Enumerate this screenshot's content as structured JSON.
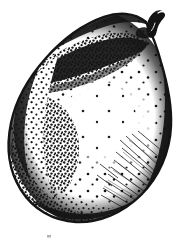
{
  "artwork": {
    "title": "Pear",
    "subject": "pear-fruit",
    "medium": "pen-and-ink stipple and hatch engraving",
    "style": "monochrome line art",
    "orientation": "upright, stem at upper right",
    "canvas": {
      "width": 184,
      "height": 243
    },
    "colors": {
      "background": "#ffffff",
      "ink": "#141414",
      "ink_mid": "#3a3a3a",
      "ink_light": "#777777"
    },
    "parts": [
      {
        "id": "stem",
        "label": "Stem",
        "note": "short dark curved stalk at top right, tilted right"
      },
      {
        "id": "body",
        "label": "Body",
        "note": "rounded pear silhouette, narrow shoulder top right, broad base lower left"
      },
      {
        "id": "shadow-band",
        "label": "Shading band",
        "note": "dense diagonal stipple band across upper left to center"
      },
      {
        "id": "highlight",
        "label": "Highlight",
        "note": "pale sparse-stipple region right of center"
      },
      {
        "id": "rim-shadow",
        "label": "Rim shadow",
        "note": "thick dark outline heaviest along right and lower edge"
      },
      {
        "id": "hatching",
        "label": "Hatch lines",
        "note": "fine radiating strokes from lower right rim toward center"
      },
      {
        "id": "base-mark",
        "label": "Base mark",
        "note": "faint small pencil tick below the fruit, left of centre"
      }
    ]
  },
  "labels": {
    "base_mark_glyph": "·"
  }
}
